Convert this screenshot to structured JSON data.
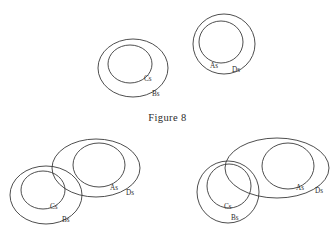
{
  "figure": {
    "caption": "Figure 8",
    "caption_x": 0,
    "caption_y": 112,
    "background_color": "#ffffff",
    "stroke_color": "#3a3a3a",
    "label_color": "#2b2b2b",
    "width": 335,
    "height": 244
  },
  "diagrams": [
    {
      "id": "top-left",
      "description": "Cs entirely inside Bs, disjoint from the As/Ds group",
      "shapes": [
        {
          "name": "Bs",
          "label": "Bs",
          "type": "ellipse",
          "cx": 133,
          "cy": 68,
          "rx": 35,
          "ry": 29,
          "label_x": 152,
          "label_y": 96
        },
        {
          "name": "Cs",
          "label": "Cs",
          "type": "ellipse",
          "cx": 130,
          "cy": 64,
          "rx": 22,
          "ry": 19,
          "label_x": 144,
          "label_y": 81
        }
      ]
    },
    {
      "id": "top-right",
      "description": "As entirely inside Ds, disjoint from the Bs/Cs group",
      "shapes": [
        {
          "name": "Ds",
          "label": "Ds",
          "type": "ellipse",
          "cx": 224,
          "cy": 44,
          "rx": 31,
          "ry": 30,
          "label_x": 232,
          "label_y": 72
        },
        {
          "name": "As",
          "label": "As",
          "type": "ellipse",
          "cx": 221,
          "cy": 42,
          "rx": 22,
          "ry": 21,
          "label_x": 210,
          "label_y": 68
        }
      ]
    },
    {
      "id": "bottom-left",
      "description": "Cs inside Bs; Bs overlaps Ds; As inside Ds; Cs disjoint from Ds",
      "shapes": [
        {
          "name": "Bs",
          "label": "Bs",
          "type": "ellipse",
          "cx": 46,
          "cy": 195,
          "rx": 36,
          "ry": 29,
          "label_x": 62,
          "label_y": 222
        },
        {
          "name": "Cs",
          "label": "Cs",
          "type": "ellipse",
          "cx": 43,
          "cy": 190,
          "rx": 22,
          "ry": 19,
          "label_x": 50,
          "label_y": 209
        },
        {
          "name": "Ds",
          "label": "Ds",
          "type": "ellipse",
          "cx": 96,
          "cy": 168,
          "rx": 44,
          "ry": 29,
          "label_x": 126,
          "label_y": 195
        },
        {
          "name": "As",
          "label": "As",
          "type": "ellipse",
          "cx": 99,
          "cy": 165,
          "rx": 26,
          "ry": 22,
          "label_x": 110,
          "label_y": 190
        }
      ]
    },
    {
      "id": "bottom-right",
      "description": "Cs inside Bs; Bs overlaps Ds; Cs also crosses the Ds boundary; As inside Ds",
      "shapes": [
        {
          "name": "Bs",
          "label": "Bs",
          "type": "ellipse",
          "cx": 228,
          "cy": 192,
          "rx": 31,
          "ry": 31,
          "label_x": 231,
          "label_y": 220
        },
        {
          "name": "Cs",
          "label": "Cs",
          "type": "ellipse",
          "cx": 229,
          "cy": 186,
          "rx": 22,
          "ry": 22,
          "label_x": 224,
          "label_y": 209
        },
        {
          "name": "Ds",
          "label": "Ds",
          "type": "ellipse",
          "cx": 277,
          "cy": 168,
          "rx": 52,
          "ry": 30,
          "label_x": 315,
          "label_y": 193
        },
        {
          "name": "As",
          "label": "As",
          "type": "ellipse",
          "cx": 288,
          "cy": 166,
          "rx": 26,
          "ry": 23,
          "label_x": 296,
          "label_y": 190
        }
      ]
    }
  ]
}
